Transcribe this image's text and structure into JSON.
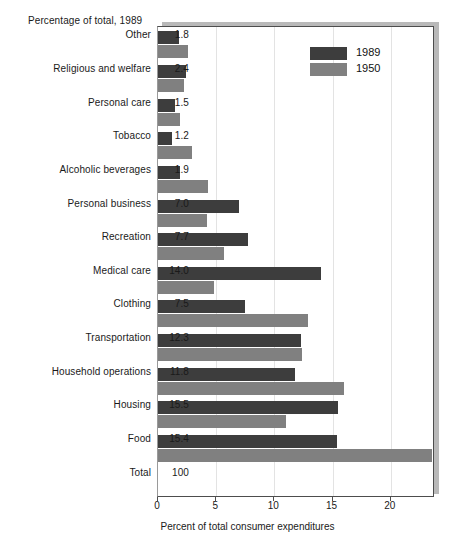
{
  "header": {
    "label": "Percentage of total, 1989"
  },
  "legend": {
    "position": "top-right",
    "items": [
      {
        "label": "1989",
        "color": "#3d3d3d",
        "name": "legend-swatch-1989"
      },
      {
        "label": "1950",
        "color": "#808080",
        "name": "legend-swatch-1950"
      }
    ]
  },
  "axis": {
    "xlabel": "Percent of total consumer expenditures",
    "ticks": [
      "0",
      "5",
      "10",
      "15",
      "20"
    ],
    "tick_values": [
      0,
      5,
      10,
      15,
      20
    ],
    "xlim": [
      0,
      23.8
    ]
  },
  "chart_data": {
    "type": "bar",
    "orientation": "horizontal",
    "title": "Percentage of total, 1989",
    "xlabel": "Percent of total consumer expenditures",
    "ylabel": "",
    "xlim": [
      0,
      23.8
    ],
    "grid": true,
    "legend_position": "top-right",
    "categories": [
      "Other",
      "Religious and welfare",
      "Personal care",
      "Tobacco",
      "Alcoholic beverages",
      "Personal business",
      "Recreation",
      "Medical care",
      "Clothing",
      "Transportation",
      "Household operations",
      "Housing",
      "Food",
      "Total"
    ],
    "value_labels": [
      "1.8",
      "2.4",
      "1.5",
      "1.2",
      "1.9",
      "7.0",
      "7.7",
      "14.0",
      "7.5",
      "12.3",
      "11.8",
      "15.5",
      "15.4",
      "100"
    ],
    "series": [
      {
        "name": "1989",
        "color": "#3d3d3d",
        "values": [
          1.8,
          2.4,
          1.5,
          1.2,
          1.9,
          7.0,
          7.7,
          14.0,
          7.5,
          12.3,
          11.8,
          15.5,
          15.4,
          null
        ]
      },
      {
        "name": "1950",
        "color": "#808080",
        "values": [
          2.6,
          2.2,
          1.9,
          2.9,
          4.3,
          4.2,
          5.7,
          4.8,
          12.9,
          12.4,
          16.0,
          11.0,
          23.5,
          null
        ]
      }
    ]
  }
}
